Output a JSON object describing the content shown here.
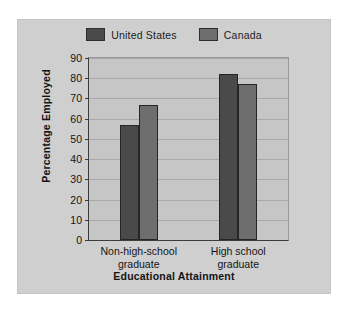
{
  "chart_data": {
    "type": "bar",
    "title": "",
    "xlabel": "Educational Attainment",
    "ylabel": "Percentage Employed",
    "categories": [
      "Non-high-school graduate",
      "High school graduate"
    ],
    "category_lines": [
      [
        "Non-high-school",
        "graduate"
      ],
      [
        "High school",
        "graduate"
      ]
    ],
    "series": [
      {
        "name": "United States",
        "color": "#4a4a4a",
        "values": [
          57,
          82
        ]
      },
      {
        "name": "Canada",
        "color": "#6e6e6e",
        "values": [
          67,
          77
        ]
      }
    ],
    "ylim": [
      0,
      90
    ],
    "ytick_step": 10,
    "yticks": [
      90,
      80,
      70,
      60,
      50,
      40,
      30,
      20,
      10,
      0
    ],
    "grid": true,
    "legend_position": "top-center",
    "plot_background": "#c6c6c6",
    "figure_background": "#cfcfcf",
    "axis_color": "#3c3c3c"
  }
}
